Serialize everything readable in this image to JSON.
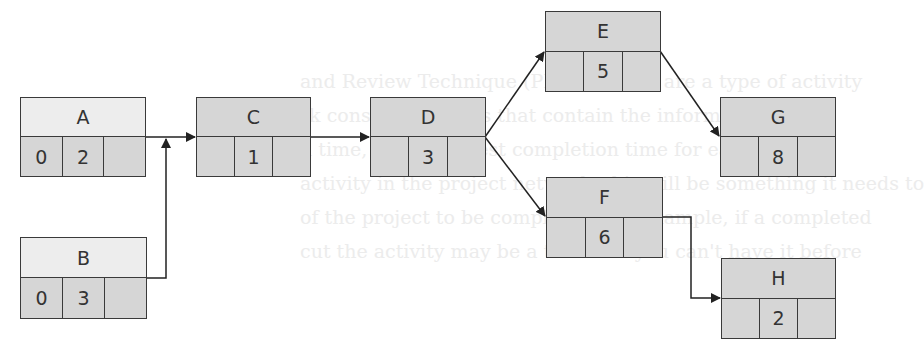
{
  "diagram": {
    "type": "activity-on-node network",
    "colors": {
      "node_fill": "#d6d6d6",
      "start_header_fill": "#ededed",
      "border": "#3a3a3a",
      "edge": "#222222"
    },
    "nodes": [
      {
        "id": "A",
        "label": "A",
        "es": "0",
        "duration": "2",
        "ls": ""
      },
      {
        "id": "B",
        "label": "B",
        "es": "0",
        "duration": "3",
        "ls": ""
      },
      {
        "id": "C",
        "label": "C",
        "es": "",
        "duration": "1",
        "ls": ""
      },
      {
        "id": "D",
        "label": "D",
        "es": "",
        "duration": "3",
        "ls": ""
      },
      {
        "id": "E",
        "label": "E",
        "es": "",
        "duration": "5",
        "ls": ""
      },
      {
        "id": "F",
        "label": "F",
        "es": "",
        "duration": "6",
        "ls": ""
      },
      {
        "id": "G",
        "label": "G",
        "es": "",
        "duration": "8",
        "ls": ""
      },
      {
        "id": "H",
        "label": "H",
        "es": "",
        "duration": "2",
        "ls": ""
      }
    ],
    "edges": [
      {
        "from": "A",
        "to": "C"
      },
      {
        "from": "B",
        "to": "C"
      },
      {
        "from": "C",
        "to": "D"
      },
      {
        "from": "D",
        "to": "E"
      },
      {
        "from": "D",
        "to": "F"
      },
      {
        "from": "E",
        "to": "G"
      },
      {
        "from": "F",
        "to": "H"
      }
    ]
  },
  "background_text": {
    "line1": "and Review Technique (PERT) charts are a type of activity",
    "line2": "rk consists of nodes that contain the information about",
    "line3": "n time, and the latest completion time for each activity.",
    "line4": "activity in the project network, this will be something it needs to",
    "line5": "of the project to be completed. For example, if a completed",
    "line6": "cut the activity may be a task that you can't have it before"
  }
}
